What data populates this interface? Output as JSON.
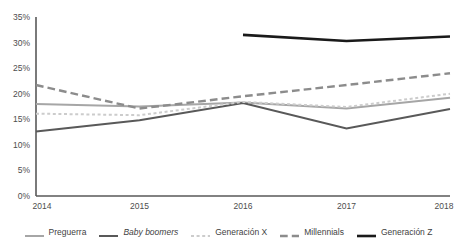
{
  "chart_data": {
    "type": "line",
    "title": "",
    "subtitle": "",
    "xlabel": "",
    "ylabel": "",
    "x": [
      "2014",
      "2015",
      "2016",
      "2017",
      "2018"
    ],
    "categories": [
      "2014",
      "2015",
      "2016",
      "2017",
      "2018"
    ],
    "ylim": [
      0,
      35
    ],
    "ytick_values": [
      0,
      5,
      10,
      15,
      20,
      25,
      30,
      35
    ],
    "ytick_labels": [
      "0%",
      "5%",
      "10%",
      "15%",
      "20%",
      "25%",
      "30%",
      "35%"
    ],
    "xtick_labels": [
      "2014",
      "2015",
      "2016",
      "2017",
      "2018"
    ],
    "grid": false,
    "legend_position": "bottom",
    "value_suffix": "%",
    "series": [
      {
        "name": "Preguerra",
        "legend_label": "Preguerra",
        "style": "solid",
        "italic": false,
        "color": "#a6a6a6",
        "width": 2.0,
        "values": [
          18.0,
          17.5,
          18.3,
          17.1,
          19.2
        ]
      },
      {
        "name": "Baby boomers",
        "legend_label": "Baby boomers",
        "style": "solid",
        "italic": true,
        "color": "#595959",
        "width": 2.0,
        "values": [
          12.6,
          14.8,
          18.2,
          13.2,
          17.0
        ]
      },
      {
        "name": "Generación X",
        "legend_label": "Generación X",
        "style": "dotted",
        "italic": false,
        "color": "#cccccc",
        "width": 2.0,
        "values": [
          16.1,
          15.8,
          18.4,
          17.4,
          20.0
        ]
      },
      {
        "name": "Millennials",
        "legend_label": "Millennials",
        "style": "dashed",
        "italic": false,
        "color": "#8c8c8c",
        "width": 2.4,
        "values": [
          21.7,
          17.1,
          19.5,
          21.7,
          24.0
        ]
      },
      {
        "name": "Generación Z",
        "legend_label": "Generación Z",
        "style": "solid",
        "italic": false,
        "color": "#1a1a1a",
        "width": 2.6,
        "values": [
          null,
          null,
          31.5,
          30.3,
          31.2
        ]
      }
    ],
    "axis_color": "#595959",
    "background_color": "#ffffff"
  },
  "legend": {
    "items": [
      {
        "label": "Preguerra"
      },
      {
        "label": "Baby boomers"
      },
      {
        "label": "Generación X"
      },
      {
        "label": "Millennials"
      },
      {
        "label": "Generación Z"
      }
    ]
  }
}
